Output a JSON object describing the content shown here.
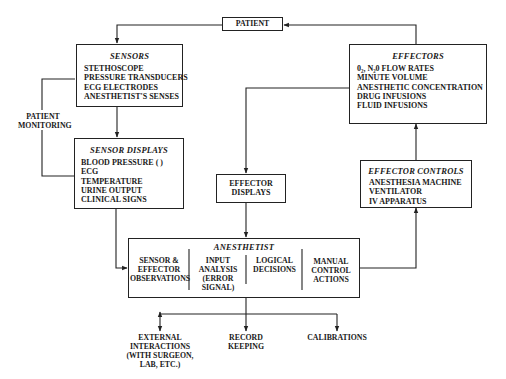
{
  "patient": {
    "label": "PATIENT"
  },
  "sensors": {
    "title": "SENSORS",
    "items": [
      "STETHOSCOPE",
      "PRESSURE TRANSDUCERS",
      "ECG ELECTRODES",
      "ANESTHETIST'S SENSES"
    ]
  },
  "patient_monitoring": {
    "line1": "PATIENT",
    "line2": "MONITORING"
  },
  "sensor_displays": {
    "title": "SENSOR DISPLAYS",
    "items": [
      "BLOOD PRESSURE ( )",
      "ECG",
      "TEMPERATURE",
      "URINE OUTPUT",
      "CLINICAL SIGNS"
    ]
  },
  "effectors": {
    "title": "EFFECTORS",
    "items": [
      "0₂, N₂0 FLOW RATES",
      "MINUTE VOLUME",
      "ANESTHETIC CONCENTRATION",
      "DRUG INFUSIONS",
      "FLUID INFUSIONS"
    ]
  },
  "effector_displays": {
    "line1": "EFFECTOR",
    "line2": "DISPLAYS"
  },
  "effector_controls": {
    "title": "EFFECTOR CONTROLS",
    "items": [
      "ANESTHESIA MACHINE",
      "VENTILATOR",
      "IV APPARATUS"
    ]
  },
  "anesthetist": {
    "title": "ANESTHETIST",
    "columns": [
      {
        "lines": [
          "SENSOR &",
          "EFFECTOR",
          "OBSERVATIONS"
        ]
      },
      {
        "lines": [
          "INPUT",
          "ANALYSIS",
          "(ERROR",
          "SIGNAL)"
        ]
      },
      {
        "lines": [
          "LOGICAL",
          "DECISIONS"
        ]
      },
      {
        "lines": [
          "MANUAL",
          "CONTROL",
          "ACTIONS"
        ]
      }
    ]
  },
  "outputs": {
    "external": {
      "lines": [
        "EXTERNAL",
        "INTERACTIONS",
        "(WITH SURGEON,",
        "LAB, ETC.)"
      ]
    },
    "record": {
      "lines": [
        "RECORD",
        "KEEPING"
      ]
    },
    "calibrations": {
      "lines": [
        "CALIBRATIONS"
      ]
    }
  }
}
